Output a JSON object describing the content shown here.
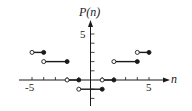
{
  "chart_data": {
    "type": "line",
    "title": "",
    "xlabel": "n",
    "ylabel": "P(n)",
    "xlim": [
      -6.5,
      7
    ],
    "ylim": [
      -2.5,
      6.5
    ],
    "x_tick_labels": [
      {
        "value": -5,
        "label": "-5"
      },
      {
        "value": 5,
        "label": "5"
      }
    ],
    "y_tick_labels": [
      {
        "value": 5,
        "label": "5"
      }
    ],
    "x_ticks": [
      -5,
      -4,
      -3,
      -2,
      -1,
      1,
      2,
      3,
      4,
      5
    ],
    "y_ticks": [
      -2,
      -1,
      1,
      2,
      3,
      4,
      5
    ],
    "grid": false,
    "legend": null,
    "series": [
      {
        "name": "P(n) step function",
        "segments": [
          {
            "x0": -5,
            "x1": -4,
            "y": 3,
            "left": "open",
            "right": "closed"
          },
          {
            "x0": -4,
            "x1": -2,
            "y": 2,
            "left": "open",
            "right": "closed"
          },
          {
            "x0": -2,
            "x1": -1,
            "y": 0,
            "left": "open",
            "right": "closed"
          },
          {
            "x0": -1,
            "x1": 1,
            "y": -1,
            "left": "open",
            "right": "closed"
          },
          {
            "x0": 1,
            "x1": 2,
            "y": 0,
            "left": "open",
            "right": "closed"
          },
          {
            "x0": 2,
            "x1": 4,
            "y": 2,
            "left": "open",
            "right": "closed"
          },
          {
            "x0": 4,
            "x1": 5,
            "y": 3,
            "left": "open",
            "right": "closed"
          }
        ]
      }
    ]
  },
  "labels": {
    "ylabel_text": "P(n)",
    "xlabel_text": "n",
    "x_neg5": "-5",
    "x_pos5": "5",
    "y_pos5": "5"
  },
  "colors": {
    "ink": "#1a1a1a",
    "background": "#ffffff"
  }
}
